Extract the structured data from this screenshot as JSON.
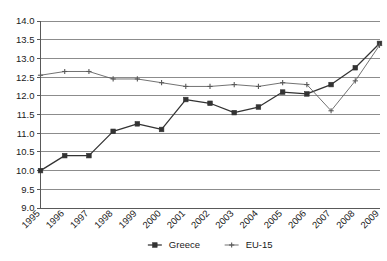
{
  "chart_data": {
    "type": "line",
    "title": "",
    "subtitle": "",
    "xlabel": "",
    "ylabel": "",
    "ylim": [
      9.0,
      14.0
    ],
    "ytick_step": 0.5,
    "grid": "horizontal",
    "legend_position": "bottom-center",
    "categories": [
      "1995",
      "1996",
      "1997",
      "1998",
      "1999",
      "2000",
      "2001",
      "2002",
      "2003",
      "2004",
      "2005",
      "2006",
      "2007",
      "2008",
      "2009"
    ],
    "ytick_labels": [
      "9.0",
      "9.5",
      "10.0",
      "10.5",
      "11.0",
      "11.5",
      "12.0",
      "12.5",
      "13.0",
      "13.5",
      "14.0"
    ],
    "ytick_values": [
      9.0,
      9.5,
      10.0,
      10.5,
      11.0,
      11.5,
      12.0,
      12.5,
      13.0,
      13.5,
      14.0
    ],
    "series": [
      {
        "name": "Greece",
        "marker": "square",
        "color": "#333333",
        "values": [
          10.0,
          10.4,
          10.4,
          11.05,
          11.25,
          11.1,
          11.9,
          11.8,
          11.55,
          11.7,
          12.1,
          12.05,
          12.3,
          12.75,
          13.4
        ]
      },
      {
        "name": "EU-15",
        "marker": "cross",
        "color": "#595959",
        "values": [
          12.55,
          12.65,
          12.65,
          12.45,
          12.45,
          12.35,
          12.25,
          12.25,
          12.3,
          12.25,
          12.35,
          12.3,
          11.6,
          12.4,
          13.35
        ]
      }
    ]
  },
  "legend": {
    "items": [
      {
        "label": "Greece",
        "marker": "square"
      },
      {
        "label": "EU-15",
        "marker": "cross"
      }
    ]
  },
  "colors": {
    "greece": "#333333",
    "eu15": "#595959",
    "gridline": "#808080",
    "axis": "#595959",
    "text": "#1a1a1a",
    "background": "#ffffff"
  }
}
